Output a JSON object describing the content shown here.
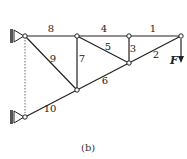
{
  "diagram": {
    "type": "truss",
    "caption": "(b)",
    "nodes": {
      "A": [
        25,
        36
      ],
      "B": [
        77,
        36
      ],
      "C": [
        129,
        36
      ],
      "D": [
        181,
        36
      ],
      "E": [
        129,
        63
      ],
      "G": [
        77,
        90
      ],
      "H": [
        25,
        117
      ]
    },
    "members": [
      {
        "label": "1",
        "from": "C",
        "to": "D",
        "lx": 153,
        "ly": 32
      },
      {
        "label": "2",
        "from": "E",
        "to": "D",
        "lx": 156,
        "ly": 58
      },
      {
        "label": "3",
        "from": "C",
        "to": "E",
        "lx": 133,
        "ly": 52
      },
      {
        "label": "4",
        "from": "B",
        "to": "C",
        "lx": 104,
        "ly": 32
      },
      {
        "label": "5",
        "from": "B",
        "to": "E",
        "lx": 108,
        "ly": 50
      },
      {
        "label": "6",
        "from": "G",
        "to": "E",
        "lx": 105,
        "ly": 84
      },
      {
        "label": "7",
        "from": "B",
        "to": "G",
        "lx": 82,
        "ly": 62
      },
      {
        "label": "8",
        "from": "A",
        "to": "B",
        "lx": 51,
        "ly": 32
      },
      {
        "label": "9",
        "from": "A",
        "to": "G",
        "lx": 53,
        "ly": 62
      },
      {
        "label": "10",
        "from": "H",
        "to": "G",
        "lx": 50,
        "ly": 112
      }
    ],
    "load": {
      "label": "F",
      "node": "D",
      "direction": "down"
    },
    "supports": [
      "A",
      "H"
    ]
  }
}
